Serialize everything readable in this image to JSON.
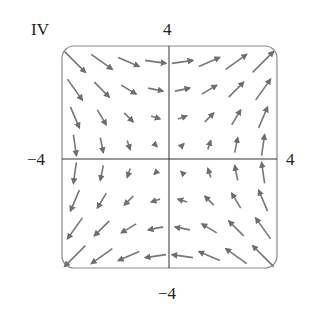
{
  "figure": {
    "panel_label": "IV",
    "axis_labels": {
      "y_max": "4",
      "y_min": "−4",
      "x_min": "−4",
      "x_max": "4"
    },
    "colors": {
      "arrow": "#777777",
      "arrow_head": "#6e6e6e",
      "frame": "#8a8a8a",
      "axes": "#333333",
      "text": "#222222"
    }
  },
  "chart_data": {
    "type": "vector_field",
    "title": "IV",
    "field": "F(x, y) = (y, x)",
    "xlim": [
      -4,
      4
    ],
    "ylim": [
      -4,
      4
    ],
    "xticks": [
      "−4",
      "4"
    ],
    "yticks": [
      "−4",
      "4"
    ],
    "grid_x": [
      -3.5,
      -2.5,
      -1.5,
      -0.5,
      0.5,
      1.5,
      2.5,
      3.5
    ],
    "grid_y": [
      3.5,
      2.5,
      1.5,
      0.5,
      -0.5,
      -1.5,
      -2.5,
      -3.5
    ]
  }
}
